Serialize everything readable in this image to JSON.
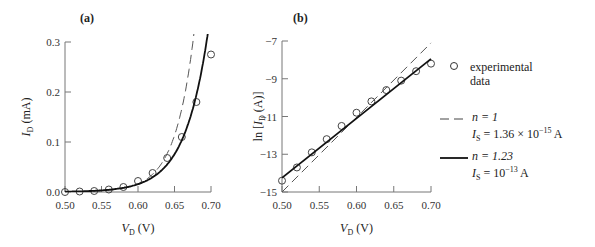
{
  "chart_data": [
    {
      "panel": "(a)",
      "type": "line",
      "xlabel": "V_D (V)",
      "ylabel": "I_D (mA)",
      "xlim": [
        0.5,
        0.7
      ],
      "ylim": [
        0.0,
        0.3
      ],
      "xticks": [
        "0.50",
        "0.55",
        "0.60",
        "0.65",
        "0.70"
      ],
      "yticks": [
        "0.0",
        "0.1",
        "0.2",
        "0.3"
      ],
      "grid": false,
      "x": [
        0.5,
        0.52,
        0.54,
        0.56,
        0.58,
        0.6,
        0.62,
        0.64,
        0.66,
        0.68,
        0.7
      ],
      "series": [
        {
          "name": "experimental data",
          "style": "circles",
          "values": [
            0.0,
            0.001,
            0.002,
            0.005,
            0.01,
            0.022,
            0.038,
            0.068,
            0.11,
            0.18,
            0.275
          ]
        },
        {
          "name": "n = 1, I_S = 1.36 × 10^-15 A",
          "style": "dashed",
          "model": {
            "n": 1,
            "Is": 1.36e-15
          }
        },
        {
          "name": "n = 1.23, I_S = 10^-13 A",
          "style": "solid",
          "model": {
            "n": 1.23,
            "Is": 1e-13
          }
        }
      ]
    },
    {
      "panel": "(b)",
      "type": "line",
      "xlabel": "V_D (V)",
      "ylabel": "ln [I_D (A)]",
      "xlim": [
        0.5,
        0.7
      ],
      "ylim": [
        -15,
        -7
      ],
      "xticks": [
        "0.50",
        "0.55",
        "0.60",
        "0.65",
        "0.70"
      ],
      "yticks": [
        "-7",
        "-9",
        "-11",
        "-13",
        "-15"
      ],
      "grid": false,
      "x": [
        0.5,
        0.52,
        0.54,
        0.56,
        0.58,
        0.6,
        0.62,
        0.64,
        0.66,
        0.68,
        0.7
      ],
      "series": [
        {
          "name": "experimental data",
          "style": "circles",
          "values": [
            -14.4,
            -13.7,
            -12.9,
            -12.2,
            -11.5,
            -10.8,
            -10.2,
            -9.6,
            -9.1,
            -8.6,
            -8.2
          ]
        },
        {
          "name": "n = 1, I_S = 1.36 × 10^-15 A",
          "style": "dashed",
          "line": [
            [
              0.5,
              -15.0
            ],
            [
              0.7,
              -7.1
            ]
          ]
        },
        {
          "name": "n = 1.23, I_S = 10^-13 A",
          "style": "solid",
          "line": [
            [
              0.5,
              -14.25
            ],
            [
              0.7,
              -7.95
            ]
          ]
        }
      ]
    }
  ],
  "labels": {
    "panel_a": "(a)",
    "panel_b": "(b)",
    "a_ylabel_main": "I",
    "a_ylabel_sub": "D",
    "a_ylabel_unit": " (mA)",
    "b_ylabel_pre": "ln [",
    "b_ylabel_main": "I",
    "b_ylabel_sub": "D",
    "b_ylabel_unit": " (A)]",
    "xlabel_main": "V",
    "xlabel_sub": "D",
    "xlabel_unit": " (V)"
  },
  "legend": {
    "exp_line1": "experimental",
    "exp_line2": "data",
    "dash_n": "n = 1",
    "dash_is_pre": "I",
    "dash_is_sub": "S",
    "dash_is_val": " = 1.36 × 10",
    "dash_is_exp": "−15",
    "dash_is_unit": " A",
    "solid_n": "n = 1.23",
    "solid_is_pre": "I",
    "solid_is_sub": "S",
    "solid_is_val": " = 10",
    "solid_is_exp": "−13",
    "solid_is_unit": " A"
  }
}
